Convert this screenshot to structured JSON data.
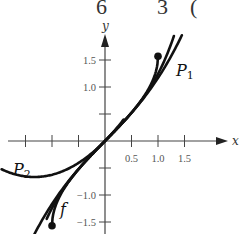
{
  "header_fragments": [
    {
      "text": "6",
      "x": 96
    },
    {
      "text": "3",
      "x": 157
    },
    {
      "text": "(",
      "x": 190
    }
  ],
  "chart_data": {
    "type": "line",
    "title": "",
    "xlabel": "x",
    "ylabel": "y",
    "xlim": [
      -2.0,
      1.7
    ],
    "ylim": [
      -1.7,
      1.8
    ],
    "x_ticks": [
      -1.5,
      -1.0,
      -0.5,
      0.5,
      1.0,
      1.5
    ],
    "x_tick_labels": [
      "0.5",
      "1.0",
      "1.5"
    ],
    "y_ticks": [
      -1.5,
      -1.0,
      -0.5,
      0.5,
      1.0,
      1.5
    ],
    "y_tick_labels": [
      "-1.5",
      "-1.0",
      "1.0",
      "1.5"
    ],
    "grid": false,
    "series": [
      {
        "name": "f",
        "label": "f",
        "description": "f(x) = arcsin x on [-1, 1], endpoints marked with dots",
        "x_range": [
          -1,
          1
        ]
      },
      {
        "name": "P1",
        "label": "P₁",
        "description": "approximating polynomial, x + x^3/6 shape",
        "x_range": [
          -1.0,
          1.5
        ]
      },
      {
        "name": "P2",
        "label": "P₂",
        "description": "second approximation, dips below axis on the left",
        "x_range": [
          -2.0,
          0.9
        ]
      }
    ],
    "endpoints": [
      {
        "x": 1.0,
        "y": 1.5708
      },
      {
        "x": -1.0,
        "y": -1.5708
      }
    ]
  }
}
